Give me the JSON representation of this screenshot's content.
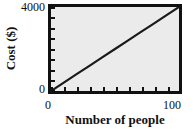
{
  "chart_data": {
    "type": "line",
    "title": "",
    "xlabel": "Number of people",
    "ylabel": "Cost ($)",
    "xlim": [
      0,
      100
    ],
    "ylim": [
      0,
      4000
    ],
    "xticks": [
      0,
      10,
      20,
      30,
      40,
      50,
      60,
      70,
      80,
      90,
      100
    ],
    "yticks": [
      0,
      500,
      1000,
      1500,
      2000,
      2500,
      3000,
      3500,
      4000
    ],
    "xtick_labels": [
      "0",
      "100"
    ],
    "ytick_labels": [
      "0",
      "4000"
    ],
    "grid": false,
    "legend": null,
    "series": [
      {
        "name": "Cost",
        "x": [
          0,
          10,
          20,
          30,
          40,
          50,
          60,
          70,
          80,
          90,
          100
        ],
        "values": [
          0,
          400,
          800,
          1200,
          1600,
          2000,
          2400,
          2800,
          3200,
          3600,
          4000
        ]
      }
    ],
    "colors": {
      "line": "#1a1a1a",
      "plot_background": "#ebebeb",
      "frame": "#111111",
      "text": "#111111",
      "page_background": "#ffffff"
    }
  },
  "axes": {
    "y_top_label": "4000",
    "y_bottom_label": "0",
    "x_left_label": "0",
    "x_right_label": "100",
    "y_title": "Cost ($)",
    "x_title": "Number of people"
  }
}
